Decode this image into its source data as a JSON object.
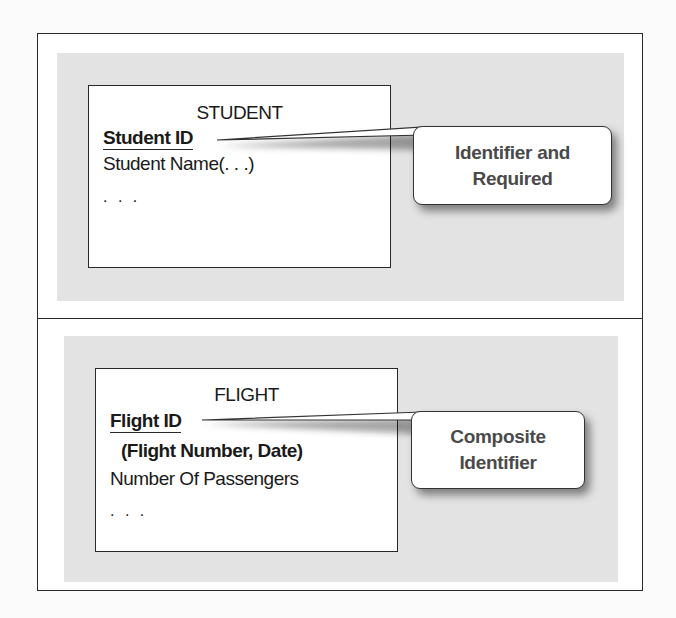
{
  "diagram": {
    "top_example": {
      "entity": {
        "title": "STUDENT",
        "identifier": "Student ID",
        "attributes": [
          "Student Name(. . .)"
        ],
        "ellipsis": ". . ."
      },
      "callout": {
        "line1": "Identifier and",
        "line2": "Required"
      }
    },
    "bottom_example": {
      "entity": {
        "title": "FLIGHT",
        "identifier": "Flight ID",
        "identifier_components": "(Flight Number, Date)",
        "attributes": [
          "Number Of Passengers"
        ],
        "ellipsis": ". . ."
      },
      "callout": {
        "line1": "Composite",
        "line2": "Identifier"
      }
    },
    "colors": {
      "panel_gray": "#e3e3e3",
      "border": "#2a2a2a",
      "callout_text": "#4a4a4a"
    }
  }
}
